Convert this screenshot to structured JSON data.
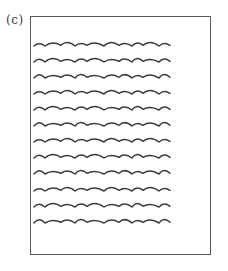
{
  "figure": {
    "label": "(c)",
    "frame_color": "#5a5a5a",
    "line_color": "#3c3c3c",
    "page": {
      "description": "page outline containing placeholder wavy text lines",
      "line_count": 12,
      "lines_x_start": 34,
      "lines_x_end": 170,
      "lines_y": [
        45,
        61,
        77,
        93,
        109,
        125,
        141,
        157,
        173,
        190,
        206,
        222
      ]
    }
  }
}
